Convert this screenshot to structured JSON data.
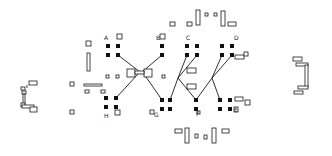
{
  "diagram": {
    "type": "hand-drawn layout sketch",
    "colors": {
      "ink": "#1a1a1a",
      "background": "#ffffff"
    },
    "labels": [
      {
        "id": "A",
        "text": "A",
        "x": 104,
        "y": 40
      },
      {
        "id": "B",
        "text": "B",
        "x": 156,
        "y": 40
      },
      {
        "id": "C",
        "text": "C",
        "x": 186,
        "y": 40
      },
      {
        "id": "D",
        "text": "D",
        "x": 234,
        "y": 40
      },
      {
        "id": "E",
        "text": "E",
        "x": 234,
        "y": 112
      },
      {
        "id": "F",
        "text": "F",
        "x": 196,
        "y": 116
      },
      {
        "id": "G",
        "text": "G",
        "x": 154,
        "y": 117
      },
      {
        "id": "H",
        "text": "H",
        "x": 104,
        "y": 118
      }
    ],
    "filled_pads": [
      [
        108,
        46
      ],
      [
        118,
        46
      ],
      [
        108,
        55
      ],
      [
        118,
        55
      ],
      [
        162,
        46
      ],
      [
        162,
        55
      ],
      [
        187,
        46
      ],
      [
        197,
        46
      ],
      [
        187,
        55
      ],
      [
        197,
        55
      ],
      [
        222,
        46
      ],
      [
        232,
        46
      ],
      [
        222,
        55
      ],
      [
        232,
        55
      ],
      [
        106,
        98
      ],
      [
        116,
        98
      ],
      [
        106,
        107
      ],
      [
        116,
        107
      ],
      [
        162,
        100
      ],
      [
        162,
        109
      ],
      [
        170,
        100
      ],
      [
        170,
        109
      ],
      [
        196,
        100
      ],
      [
        196,
        109
      ],
      [
        220,
        100
      ],
      [
        230,
        100
      ],
      [
        220,
        109
      ],
      [
        230,
        109
      ]
    ],
    "wires": [
      [
        [
          118,
          55
        ],
        [
          140,
          72
        ]
      ],
      [
        [
          162,
          55
        ],
        [
          142,
          72
        ]
      ],
      [
        [
          138,
          74
        ],
        [
          116,
          98
        ]
      ],
      [
        [
          144,
          74
        ],
        [
          162,
          100
        ]
      ],
      [
        [
          187,
          55
        ],
        [
          178,
          78
        ],
        [
          170,
          100
        ]
      ],
      [
        [
          197,
          55
        ],
        [
          178,
          78
        ],
        [
          196,
          100
        ]
      ],
      [
        [
          222,
          55
        ],
        [
          212,
          78
        ],
        [
          196,
          100
        ]
      ],
      [
        [
          232,
          55
        ],
        [
          212,
          78
        ],
        [
          220,
          100
        ]
      ]
    ],
    "open_boxes": [
      {
        "x": 86,
        "y": 41,
        "w": 5,
        "h": 5
      },
      {
        "x": 87,
        "y": 53,
        "w": 3,
        "h": 18
      },
      {
        "x": 117,
        "y": 34,
        "w": 5,
        "h": 5
      },
      {
        "x": 160,
        "y": 34,
        "w": 5,
        "h": 5
      },
      {
        "x": 170,
        "y": 22,
        "w": 5,
        "h": 4
      },
      {
        "x": 187,
        "y": 22,
        "w": 5,
        "h": 4
      },
      {
        "x": 196,
        "y": 10,
        "w": 4,
        "h": 15
      },
      {
        "x": 205,
        "y": 13,
        "w": 3,
        "h": 3
      },
      {
        "x": 214,
        "y": 13,
        "w": 3,
        "h": 3
      },
      {
        "x": 221,
        "y": 11,
        "w": 4,
        "h": 15
      },
      {
        "x": 228,
        "y": 22,
        "w": 8,
        "h": 4
      },
      {
        "x": 235,
        "y": 55,
        "w": 9,
        "h": 4
      },
      {
        "x": 244,
        "y": 52,
        "w": 4,
        "h": 4
      },
      {
        "x": 187,
        "y": 68,
        "w": 9,
        "h": 5
      },
      {
        "x": 187,
        "y": 84,
        "w": 9,
        "h": 5
      },
      {
        "x": 235,
        "y": 97,
        "w": 8,
        "h": 4
      },
      {
        "x": 245,
        "y": 100,
        "w": 5,
        "h": 5
      },
      {
        "x": 234,
        "y": 107,
        "w": 4,
        "h": 5
      },
      {
        "x": 197,
        "y": 111,
        "w": 3,
        "h": 3
      },
      {
        "x": 150,
        "y": 110,
        "w": 4,
        "h": 4
      },
      {
        "x": 115,
        "y": 110,
        "w": 5,
        "h": 5
      },
      {
        "x": 70,
        "y": 82,
        "w": 4,
        "h": 4
      },
      {
        "x": 70,
        "y": 110,
        "w": 4,
        "h": 4
      },
      {
        "x": 84,
        "y": 84,
        "w": 18,
        "h": 2
      },
      {
        "x": 85,
        "y": 90,
        "w": 4,
        "h": 3
      },
      {
        "x": 101,
        "y": 90,
        "w": 4,
        "h": 3
      },
      {
        "x": 106,
        "y": 75,
        "w": 3,
        "h": 3
      },
      {
        "x": 116,
        "y": 75,
        "w": 3,
        "h": 3
      },
      {
        "x": 127,
        "y": 69,
        "w": 8,
        "h": 8
      },
      {
        "x": 144,
        "y": 69,
        "w": 8,
        "h": 8
      },
      {
        "x": 135,
        "y": 71,
        "w": 9,
        "h": 3
      },
      {
        "x": 162,
        "y": 75,
        "w": 3,
        "h": 3
      },
      {
        "x": 175,
        "y": 129,
        "w": 7,
        "h": 4
      },
      {
        "x": 185,
        "y": 128,
        "w": 4,
        "h": 15
      },
      {
        "x": 195,
        "y": 134,
        "w": 3,
        "h": 4
      },
      {
        "x": 204,
        "y": 135,
        "w": 3,
        "h": 4
      },
      {
        "x": 212,
        "y": 128,
        "w": 4,
        "h": 15
      },
      {
        "x": 222,
        "y": 129,
        "w": 7,
        "h": 4
      }
    ],
    "left_bracket": "┘╪└",
    "right_bracket": "┐╪┘"
  }
}
